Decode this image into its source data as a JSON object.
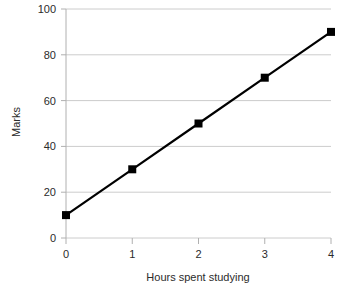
{
  "chart_data": {
    "type": "line",
    "title": "",
    "xlabel": "Hours spent studying",
    "ylabel": "Marks",
    "x": [
      0,
      1,
      2,
      3,
      4
    ],
    "values": [
      10,
      30,
      50,
      70,
      90
    ],
    "series": [
      {
        "name": "Marks",
        "values": [
          10,
          30,
          50,
          70,
          90
        ]
      }
    ],
    "xlim": [
      0,
      4
    ],
    "ylim": [
      0,
      100
    ],
    "xticks": [
      0,
      1,
      2,
      3,
      4
    ],
    "yticks": [
      0,
      20,
      40,
      60,
      80,
      100
    ],
    "xtick_labels": [
      "0",
      "1",
      "2",
      "3",
      "4"
    ],
    "ytick_labels": [
      "0",
      "20",
      "40",
      "60",
      "80",
      "100"
    ],
    "grid": "horizontal",
    "legend": "none",
    "marker": "square",
    "line_color": "#000000",
    "marker_color": "#000000",
    "grid_color": "#cccccc",
    "axis_color": "#b0b0b0",
    "background_color": "#ffffff"
  }
}
